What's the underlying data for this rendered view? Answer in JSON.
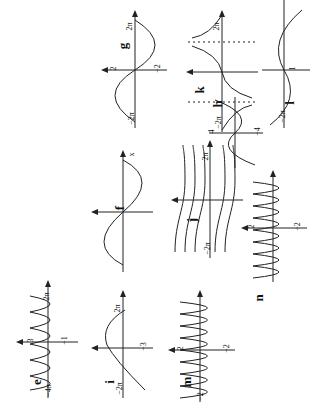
{
  "page": {
    "orientation": "rotated-90-ccw",
    "content": "Graphs of trigonometric functions, parts e–n"
  },
  "panels": {
    "e": {
      "label": "e",
      "ticks": {
        "ymax": "3",
        "ymin": "−1",
        "xmin": "−4π",
        "xmax": "2π",
        "x": "x",
        "y": "y"
      }
    },
    "f": {
      "label": "f",
      "ticks": {
        "y": "y",
        "x": "x"
      }
    },
    "g": {
      "label": "g",
      "ticks": {
        "ymax": "2",
        "ymin": "−2",
        "xmin": "−2π",
        "xmax": "2π",
        "x": "x",
        "y": "y"
      }
    },
    "h": {
      "label": "h",
      "ticks": {
        "xmin": "−2π",
        "xmax": "2π",
        "x": "x",
        "y": "y"
      }
    },
    "i": {
      "label": "i",
      "ticks": {
        "ymin": "−3",
        "xmin": "−2π",
        "xmax": "2π",
        "x": "x",
        "y": "y"
      }
    },
    "j": {
      "label": "j",
      "ticks": {
        "xmin": "−2π",
        "xmax": "2π",
        "x": "x",
        "y": "y"
      }
    },
    "k": {
      "label": "k",
      "ticks": {
        "ymax": "4",
        "ymin": "−4",
        "xmin": "−2π",
        "xmax": "2π",
        "x": "x",
        "y": "y"
      }
    },
    "l": {
      "label": "l",
      "ticks": {
        "ymin": "−3",
        "ymax": "1",
        "xmin": "−2π",
        "x2": "−2",
        "x": "x",
        "y": "y"
      }
    },
    "m": {
      "label": "m",
      "ticks": {
        "ymax": "2",
        "ymin": "−2",
        "xmin": "−2",
        "xmax": "2",
        "x": "x",
        "y": "y"
      }
    },
    "n": {
      "label": "n",
      "ticks": {
        "ymax": "2",
        "ymin": "−2",
        "xmin": "−2",
        "xmax": "2",
        "x": "x",
        "y": "y"
      }
    }
  }
}
